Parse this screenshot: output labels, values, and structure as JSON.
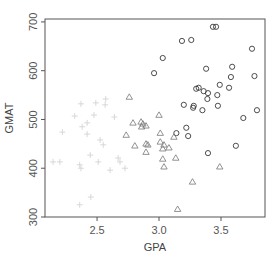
{
  "chart_data": {
    "type": "scatter",
    "title": "",
    "xlabel": "GPA",
    "ylabel": "GMAT",
    "xlim": [
      2.08,
      3.855
    ],
    "ylim": [
      300,
      706
    ],
    "xticks": [
      2.5,
      3.0,
      3.5
    ],
    "xtick_labels": [
      "2.5",
      "3.0",
      "3.5"
    ],
    "yticks": [
      300,
      400,
      500,
      600,
      700
    ],
    "ytick_labels": [
      "300",
      "400",
      "500",
      "600",
      "700"
    ],
    "grid": false,
    "legend": null,
    "series": [
      {
        "name": "group-1",
        "marker": "circle",
        "color": "#3a3a3a",
        "points": [
          [
            3.435,
            690
          ],
          [
            3.46,
            690
          ],
          [
            3.185,
            661
          ],
          [
            3.26,
            663
          ],
          [
            3.75,
            645
          ],
          [
            3.03,
            626
          ],
          [
            2.96,
            595
          ],
          [
            3.38,
            604
          ],
          [
            3.59,
            608
          ],
          [
            3.58,
            587
          ],
          [
            3.77,
            589
          ],
          [
            3.49,
            571
          ],
          [
            3.565,
            565
          ],
          [
            3.3,
            563
          ],
          [
            3.32,
            565
          ],
          [
            3.36,
            558
          ],
          [
            3.395,
            554
          ],
          [
            3.39,
            542
          ],
          [
            3.47,
            550
          ],
          [
            3.2,
            530
          ],
          [
            3.28,
            528
          ],
          [
            3.275,
            524
          ],
          [
            3.35,
            519
          ],
          [
            3.475,
            528
          ],
          [
            3.79,
            519
          ],
          [
            3.68,
            503
          ],
          [
            3.14,
            472
          ],
          [
            3.22,
            483
          ],
          [
            3.235,
            466
          ],
          [
            3.62,
            446
          ],
          [
            3.395,
            431
          ]
        ]
      },
      {
        "name": "group-2",
        "marker": "triangle",
        "color": "#777777",
        "points": [
          [
            2.76,
            546
          ],
          [
            3.0,
            509
          ],
          [
            2.79,
            493
          ],
          [
            2.855,
            495
          ],
          [
            2.87,
            491
          ],
          [
            2.895,
            487
          ],
          [
            2.86,
            485
          ],
          [
            2.735,
            468
          ],
          [
            3.01,
            472
          ],
          [
            3.12,
            464
          ],
          [
            2.895,
            450
          ],
          [
            2.91,
            448
          ],
          [
            2.805,
            446
          ],
          [
            3.01,
            454
          ],
          [
            3.04,
            448
          ],
          [
            3.03,
            440
          ],
          [
            3.08,
            442
          ],
          [
            2.895,
            433
          ],
          [
            3.03,
            419
          ],
          [
            3.135,
            421
          ],
          [
            3.04,
            403
          ],
          [
            3.49,
            403
          ],
          [
            3.27,
            372
          ],
          [
            3.15,
            316
          ]
        ]
      },
      {
        "name": "group-3",
        "marker": "plus",
        "color": "#d4d4d4",
        "points": [
          [
            2.37,
            532
          ],
          [
            2.49,
            534
          ],
          [
            2.57,
            542
          ],
          [
            2.565,
            530
          ],
          [
            2.32,
            507
          ],
          [
            2.475,
            509
          ],
          [
            2.64,
            505
          ],
          [
            2.42,
            493
          ],
          [
            2.38,
            485
          ],
          [
            2.22,
            474
          ],
          [
            2.42,
            470
          ],
          [
            2.525,
            458
          ],
          [
            2.55,
            448
          ],
          [
            2.445,
            427
          ],
          [
            2.145,
            413
          ],
          [
            2.2,
            413
          ],
          [
            2.36,
            407
          ],
          [
            2.37,
            400
          ],
          [
            2.51,
            413
          ],
          [
            2.67,
            421
          ],
          [
            2.685,
            413
          ],
          [
            2.725,
            400
          ],
          [
            2.605,
            396
          ],
          [
            2.45,
            341
          ],
          [
            2.36,
            325
          ]
        ]
      }
    ]
  }
}
